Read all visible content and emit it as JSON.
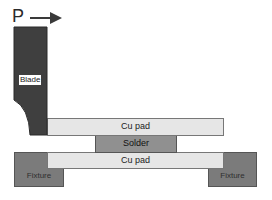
{
  "diagram": {
    "force": {
      "label": "P",
      "direction": "right"
    },
    "blade": {
      "label": "Blade",
      "color": "#3f3f3f"
    },
    "top_pad": {
      "label": "Cu pad",
      "color": "#e6e6e6"
    },
    "solder": {
      "label": "Solder",
      "color": "#909090"
    },
    "bottom_pad": {
      "label": "Cu pad",
      "color": "#e6e6e6"
    },
    "fixture_left": {
      "label": "Fixture",
      "color": "#7b7b7b"
    },
    "fixture_right": {
      "label": "Fixture",
      "color": "#7b7b7b"
    }
  }
}
